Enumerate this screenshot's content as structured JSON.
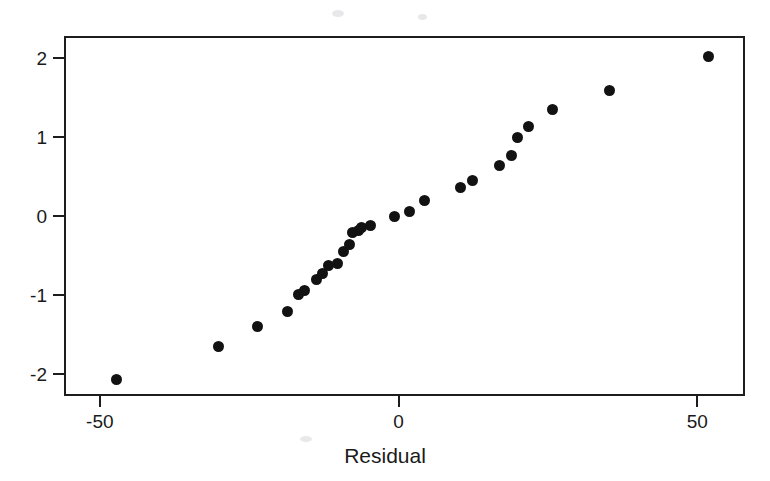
{
  "chart_data": {
    "type": "scatter",
    "xlabel": "Residual",
    "ylabel": "",
    "xlim": [
      -56,
      58
    ],
    "ylim": [
      -2.28,
      2.28
    ],
    "xticks": [
      -50,
      0,
      50
    ],
    "xtick_labels": [
      "-50",
      "0",
      "50"
    ],
    "yticks": [
      2,
      1,
      0,
      -1,
      -2
    ],
    "ytick_labels": [
      "2",
      "1",
      "0",
      "-1",
      "-2"
    ],
    "grid": false,
    "legend": null,
    "marker": "filled-circle",
    "marker_color": "#121212",
    "frame_color": "#1d1d1d",
    "background": "#ffffff",
    "n_points": 27,
    "x": [
      -47.5,
      -30.5,
      -24.0,
      -19.0,
      -17.0,
      -16.0,
      -14.0,
      -13.0,
      -12.0,
      -10.0,
      -9.0,
      -8.5,
      -8.0,
      -7.5,
      -7.0,
      -6.0,
      -1.0,
      1.5,
      4.0,
      10.0,
      12.0,
      17.0,
      18.0,
      19.5,
      21.5,
      35.0,
      51.5
    ],
    "y": [
      -2.04,
      -1.63,
      -1.38,
      -1.18,
      -0.97,
      -0.92,
      -0.78,
      -0.7,
      -0.6,
      -0.57,
      -0.43,
      -0.33,
      -0.18,
      -0.16,
      -0.12,
      -0.1,
      0.02,
      0.08,
      0.22,
      0.39,
      0.48,
      0.66,
      0.79,
      1.02,
      1.16,
      1.37,
      1.61,
      2.04
    ],
    "points": [
      {
        "x": -47.5,
        "y": -2.04
      },
      {
        "x": -30.5,
        "y": -1.63
      },
      {
        "x": -24.0,
        "y": -1.38
      },
      {
        "x": -19.0,
        "y": -1.18
      },
      {
        "x": -17.0,
        "y": -0.97
      },
      {
        "x": -16.0,
        "y": -0.92
      },
      {
        "x": -14.0,
        "y": -0.78
      },
      {
        "x": -13.0,
        "y": -0.7
      },
      {
        "x": -12.0,
        "y": -0.6
      },
      {
        "x": -10.5,
        "y": -0.57
      },
      {
        "x": -9.5,
        "y": -0.43
      },
      {
        "x": -8.5,
        "y": -0.33
      },
      {
        "x": -8.0,
        "y": -0.18
      },
      {
        "x": -7.0,
        "y": -0.16
      },
      {
        "x": -6.5,
        "y": -0.12
      },
      {
        "x": -5.0,
        "y": -0.1
      },
      {
        "x": -1.0,
        "y": 0.02
      },
      {
        "x": 1.5,
        "y": 0.08
      },
      {
        "x": 4.0,
        "y": 0.22
      },
      {
        "x": 10.0,
        "y": 0.39
      },
      {
        "x": 12.0,
        "y": 0.48
      },
      {
        "x": 16.5,
        "y": 0.66
      },
      {
        "x": 18.5,
        "y": 0.79
      },
      {
        "x": 19.5,
        "y": 1.02
      },
      {
        "x": 21.5,
        "y": 1.16
      },
      {
        "x": 25.5,
        "y": 1.37
      },
      {
        "x": 35.0,
        "y": 1.61
      },
      {
        "x": 51.5,
        "y": 2.04
      }
    ]
  },
  "axes": {
    "x_label": "Residual",
    "x_ticks": [
      "-50",
      "0",
      "50"
    ],
    "y_ticks": [
      "2",
      "1",
      "0",
      "-1",
      "-2"
    ]
  },
  "title": {
    "text": ""
  }
}
